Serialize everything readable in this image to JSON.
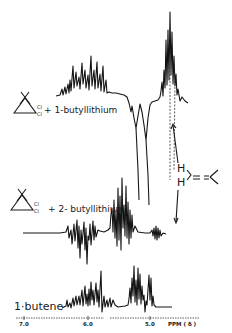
{
  "chart_data": {
    "type": "line",
    "title": "",
    "xlabel": "PPM (δ)",
    "ylabel": "",
    "x_axis": {
      "ticks": [
        7.0,
        6.0,
        5.0
      ],
      "tick_labels": [
        "7.0",
        "6.0",
        "5.0"
      ],
      "reversed": true,
      "range": [
        7.1,
        4.6
      ]
    },
    "grid": false,
    "legend": null,
    "series": [
      {
        "name": "dichlorocyclopropane + 1-butyllithium",
        "label_text": "+ 1-butyllithium",
        "substituent": "Cl",
        "baseline_y": 96,
        "points": [
          [
            56,
            96
          ],
          [
            60,
            95
          ],
          [
            62,
            89
          ],
          [
            63,
            95
          ],
          [
            65,
            87
          ],
          [
            66,
            94
          ],
          [
            68,
            84
          ],
          [
            69,
            93
          ],
          [
            70,
            80
          ],
          [
            71,
            91
          ],
          [
            73,
            66
          ],
          [
            74,
            88
          ],
          [
            76,
            72
          ],
          [
            77,
            86
          ],
          [
            79,
            77
          ],
          [
            80,
            89
          ],
          [
            82,
            63
          ],
          [
            83,
            84
          ],
          [
            85,
            70
          ],
          [
            86,
            88
          ],
          [
            88,
            75
          ],
          [
            89,
            90
          ],
          [
            91,
            56
          ],
          [
            92,
            86
          ],
          [
            94,
            70
          ],
          [
            95,
            89
          ],
          [
            97,
            62
          ],
          [
            98,
            88
          ],
          [
            100,
            74
          ],
          [
            101,
            91
          ],
          [
            103,
            66
          ],
          [
            104,
            92
          ],
          [
            106,
            80
          ],
          [
            107,
            93
          ],
          [
            109,
            92
          ],
          [
            112,
            93
          ],
          [
            116,
            93
          ],
          [
            120,
            94
          ],
          [
            124,
            95
          ],
          [
            127,
            97
          ],
          [
            129,
            103
          ],
          [
            131,
            112
          ],
          [
            132,
            106
          ],
          [
            134,
            118
          ],
          [
            136,
            128
          ],
          [
            138,
            116
          ],
          [
            140,
            104
          ],
          [
            142,
            112
          ],
          [
            144,
            125
          ],
          [
            146,
            140
          ],
          [
            148,
            118
          ],
          [
            150,
            105
          ],
          [
            152,
            102
          ],
          [
            155,
            101
          ],
          [
            158,
            100
          ],
          [
            160,
            97
          ],
          [
            161,
            91
          ],
          [
            162,
            82
          ],
          [
            163,
            96
          ],
          [
            164,
            70
          ],
          [
            165,
            88
          ],
          [
            166,
            40
          ],
          [
            167,
            85
          ],
          [
            168,
            30
          ],
          [
            169,
            80
          ],
          [
            170,
            12
          ],
          [
            171,
            75
          ],
          [
            172,
            32
          ],
          [
            173,
            84
          ],
          [
            174,
            56
          ],
          [
            175,
            86
          ],
          [
            176,
            74
          ],
          [
            177,
            95
          ],
          [
            178,
            89
          ],
          [
            180,
            101
          ],
          [
            182,
            97
          ],
          [
            185,
            101
          ],
          [
            188,
            103
          ]
        ]
      },
      {
        "name": "dichlorocyclopropane + 2-butyllithium",
        "label_text": "+ 2- butyllithium",
        "substituent": "Cl",
        "baseline_y": 233,
        "points": [
          [
            23,
            233
          ],
          [
            40,
            233
          ],
          [
            60,
            233
          ],
          [
            66,
            232
          ],
          [
            68,
            226
          ],
          [
            69,
            238
          ],
          [
            71,
            230
          ],
          [
            72,
            244
          ],
          [
            74,
            224
          ],
          [
            75,
            241
          ],
          [
            77,
            220
          ],
          [
            78,
            248
          ],
          [
            79,
            226
          ],
          [
            80,
            258
          ],
          [
            81,
            230
          ],
          [
            82,
            244
          ],
          [
            84,
            222
          ],
          [
            85,
            250
          ],
          [
            86,
            228
          ],
          [
            87,
            264
          ],
          [
            88,
            236
          ],
          [
            89,
            240
          ],
          [
            90,
            224
          ],
          [
            91,
            245
          ],
          [
            93,
            221
          ],
          [
            94,
            240
          ],
          [
            95,
            226
          ],
          [
            96,
            237
          ],
          [
            98,
            230
          ],
          [
            100,
            231
          ],
          [
            104,
            232
          ],
          [
            108,
            230
          ],
          [
            110,
            228
          ],
          [
            111,
            214
          ],
          [
            112,
            208
          ],
          [
            113,
            232
          ],
          [
            114,
            200
          ],
          [
            115,
            238
          ],
          [
            116,
            210
          ],
          [
            117,
            246
          ],
          [
            118,
            188
          ],
          [
            119,
            240
          ],
          [
            120,
            196
          ],
          [
            121,
            250
          ],
          [
            122,
            178
          ],
          [
            123,
            228
          ],
          [
            124,
            205
          ],
          [
            125,
            236
          ],
          [
            126,
            186
          ],
          [
            127,
            238
          ],
          [
            128,
            202
          ],
          [
            129,
            244
          ],
          [
            130,
            210
          ],
          [
            131,
            238
          ],
          [
            132,
            215
          ],
          [
            133,
            232
          ],
          [
            135,
            226
          ],
          [
            138,
            232
          ],
          [
            145,
            233
          ],
          [
            150,
            233
          ],
          [
            152,
            230
          ],
          [
            153,
            236
          ],
          [
            154,
            228
          ],
          [
            155,
            239
          ],
          [
            156,
            226
          ],
          [
            157,
            240
          ],
          [
            158,
            228
          ],
          [
            159,
            238
          ],
          [
            160,
            230
          ],
          [
            161,
            236
          ],
          [
            163,
            233
          ],
          [
            166,
            234
          ]
        ]
      },
      {
        "name": "1-butene",
        "label_text": "1·butene",
        "baseline_y": 308,
        "points": [
          [
            62,
            308
          ],
          [
            66,
            306
          ],
          [
            67,
            300
          ],
          [
            68,
            307
          ],
          [
            70,
            303
          ],
          [
            71,
            308
          ],
          [
            73,
            298
          ],
          [
            74,
            306
          ],
          [
            76,
            296
          ],
          [
            77,
            305
          ],
          [
            79,
            296
          ],
          [
            80,
            305
          ],
          [
            82,
            290
          ],
          [
            83,
            306
          ],
          [
            85,
            286
          ],
          [
            86,
            304
          ],
          [
            87,
            294
          ],
          [
            88,
            306
          ],
          [
            89,
            289
          ],
          [
            90,
            305
          ],
          [
            91,
            282
          ],
          [
            92,
            300
          ],
          [
            93,
            290
          ],
          [
            94,
            305
          ],
          [
            96,
            283
          ],
          [
            97,
            302
          ],
          [
            98,
            290
          ],
          [
            99,
            307
          ],
          [
            101,
            271
          ],
          [
            102,
            312
          ],
          [
            104,
            296
          ],
          [
            105,
            307
          ],
          [
            107,
            300
          ],
          [
            108,
            307
          ],
          [
            110,
            298
          ],
          [
            111,
            307
          ],
          [
            113,
            300
          ],
          [
            115,
            305
          ],
          [
            118,
            307
          ],
          [
            125,
            306
          ],
          [
            128,
            305
          ],
          [
            129,
            299
          ],
          [
            130,
            288
          ],
          [
            131,
            303
          ],
          [
            132,
            278
          ],
          [
            133,
            296
          ],
          [
            134,
            266
          ],
          [
            135,
            302
          ],
          [
            136,
            280
          ],
          [
            137,
            305
          ],
          [
            138,
            268
          ],
          [
            139,
            299
          ],
          [
            140,
            274
          ],
          [
            141,
            304
          ],
          [
            142,
            286
          ],
          [
            143,
            300
          ],
          [
            144,
            295
          ],
          [
            145,
            312
          ],
          [
            146,
            301
          ],
          [
            147,
            305
          ],
          [
            148,
            290
          ],
          [
            149,
            275
          ],
          [
            150,
            300
          ],
          [
            151,
            278
          ],
          [
            152,
            306
          ],
          [
            153,
            296
          ],
          [
            154,
            305
          ],
          [
            156,
            307
          ],
          [
            160,
            307
          ],
          [
            165,
            307
          ],
          [
            172,
            307
          ]
        ]
      }
    ],
    "annotations": [
      {
        "text": "H",
        "role": "vinylidene =CH2 hydrogens"
      },
      {
        "text": "H",
        "role": "vinylidene =CH2 hydrogens"
      },
      {
        "type": "structure",
        "text": "H2C=C< (methylenecyclopropane / vinylidene)"
      },
      {
        "type": "arrow",
        "direction": "up",
        "target": "series 1 vinyl signals ~4.7 ppm"
      },
      {
        "type": "arrow",
        "direction": "down",
        "target": "series 2 signals ~4.7 ppm"
      }
    ]
  },
  "labels": {
    "series1": "+ 1-butyllithium",
    "series2": "+ 2- butyllithium",
    "series3": "1·butene",
    "cl_top": "Cl",
    "cl_bottom": "Cl",
    "h_upper": "H",
    "h_lower": "H"
  },
  "axis": {
    "tick_7": "7.0",
    "tick_6": "6.0",
    "tick_5": "5.0",
    "unit": "PPM ( δ )"
  }
}
